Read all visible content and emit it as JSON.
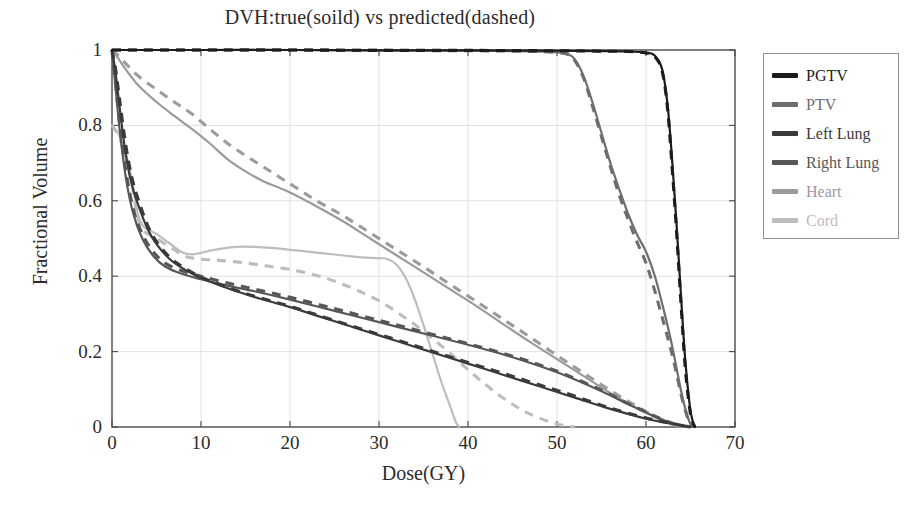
{
  "chart_data": {
    "type": "line",
    "title": "DVH:true(soild) vs predicted(dashed)",
    "xlabel": "Dose(GY)",
    "ylabel": "Fractional Volume",
    "xlim": [
      0,
      70
    ],
    "ylim": [
      0,
      1
    ],
    "xticks": [
      "0",
      "10",
      "20",
      "30",
      "40",
      "50",
      "60",
      "70"
    ],
    "xtick_values": [
      0,
      10,
      20,
      30,
      40,
      50,
      60,
      70
    ],
    "yticks": [
      "0",
      "0.2",
      "0.4",
      "0.6",
      "0.8",
      "1"
    ],
    "ytick_values": [
      0,
      0.2,
      0.4,
      0.6,
      0.8,
      1
    ],
    "grid": true,
    "legend_position": "outside-right-top",
    "linestyles": {
      "true": "solid",
      "predicted": "dashed"
    },
    "series": [
      {
        "name": "PGTV",
        "color": "#1c1c1c",
        "true": {
          "x": [
            0,
            0.5,
            1,
            2,
            5,
            10,
            20,
            30,
            40,
            50,
            55,
            58,
            60,
            61,
            61.8,
            62.4,
            62.9,
            63.4,
            63.9,
            64.4,
            64.9,
            65.2,
            65.5
          ],
          "y": [
            1,
            1,
            1,
            1,
            1,
            1,
            1,
            0.999,
            0.999,
            0.998,
            0.997,
            0.996,
            0.993,
            0.985,
            0.95,
            0.86,
            0.72,
            0.55,
            0.36,
            0.18,
            0.06,
            0.02,
            0
          ]
        },
        "predicted": {
          "x": [
            0,
            0.5,
            1,
            2,
            5,
            10,
            20,
            30,
            40,
            50,
            55,
            58,
            60,
            61,
            61.8,
            62.4,
            62.9,
            63.4,
            63.9,
            64.4,
            64.9,
            65.2,
            65.5
          ],
          "y": [
            1,
            1,
            1,
            1,
            1,
            1,
            1,
            0.999,
            0.999,
            0.998,
            0.997,
            0.996,
            0.992,
            0.982,
            0.945,
            0.85,
            0.7,
            0.53,
            0.34,
            0.16,
            0.05,
            0.015,
            0
          ]
        }
      },
      {
        "name": "PTV",
        "color": "#6e6e6e",
        "true": {
          "x": [
            0,
            1,
            5,
            10,
            20,
            30,
            40,
            45,
            49,
            51,
            52,
            53,
            54,
            55,
            56,
            57,
            58,
            59,
            60,
            61,
            62,
            62.8,
            63.4,
            63.9,
            64.4,
            64.9,
            65.2
          ],
          "y": [
            1,
            1,
            1,
            1,
            1,
            0.999,
            0.998,
            0.997,
            0.995,
            0.99,
            0.975,
            0.93,
            0.86,
            0.78,
            0.7,
            0.63,
            0.565,
            0.51,
            0.465,
            0.4,
            0.31,
            0.23,
            0.16,
            0.1,
            0.05,
            0.012,
            0
          ]
        },
        "predicted": {
          "x": [
            0,
            1,
            5,
            10,
            20,
            30,
            40,
            45,
            49,
            51,
            52,
            53,
            54,
            55,
            56,
            57,
            58,
            59,
            60,
            61,
            62,
            62.8,
            63.4,
            63.9,
            64.4,
            64.9,
            65.2
          ],
          "y": [
            1,
            1,
            1,
            1,
            1,
            0.999,
            0.998,
            0.997,
            0.995,
            0.99,
            0.972,
            0.925,
            0.85,
            0.77,
            0.69,
            0.615,
            0.55,
            0.49,
            0.435,
            0.36,
            0.275,
            0.205,
            0.145,
            0.09,
            0.045,
            0.01,
            0
          ]
        }
      },
      {
        "name": "Left Lung",
        "color": "#3a3a3a",
        "true": {
          "x": [
            0,
            0.4,
            0.9,
            1.5,
            2.2,
            3,
            4,
            5,
            6.5,
            8,
            10,
            13,
            16,
            20,
            24,
            28,
            32,
            36,
            40,
            44,
            48,
            52,
            56,
            60,
            63,
            65
          ],
          "y": [
            1,
            0.94,
            0.84,
            0.73,
            0.645,
            0.585,
            0.525,
            0.485,
            0.445,
            0.42,
            0.395,
            0.368,
            0.345,
            0.318,
            0.288,
            0.258,
            0.228,
            0.198,
            0.168,
            0.138,
            0.108,
            0.078,
            0.048,
            0.022,
            0.008,
            0
          ]
        },
        "predicted": {
          "x": [
            0,
            0.4,
            0.9,
            1.5,
            2.2,
            3,
            4,
            5,
            6.5,
            8,
            10,
            13,
            16,
            20,
            24,
            28,
            32,
            36,
            40,
            44,
            48,
            52,
            56,
            60,
            63,
            65
          ],
          "y": [
            1,
            0.95,
            0.86,
            0.755,
            0.665,
            0.6,
            0.535,
            0.492,
            0.45,
            0.424,
            0.398,
            0.37,
            0.347,
            0.32,
            0.29,
            0.26,
            0.231,
            0.201,
            0.171,
            0.142,
            0.112,
            0.082,
            0.05,
            0.024,
            0.009,
            0
          ]
        }
      },
      {
        "name": "Right Lung",
        "color": "#575757",
        "true": {
          "x": [
            0,
            0.4,
            0.9,
            1.6,
            2.4,
            3.4,
            4.6,
            6,
            8,
            10,
            13,
            16,
            20,
            25,
            30,
            35,
            40,
            45,
            50,
            55,
            58,
            61,
            63,
            65
          ],
          "y": [
            1,
            0.9,
            0.78,
            0.655,
            0.565,
            0.5,
            0.455,
            0.425,
            0.405,
            0.392,
            0.375,
            0.36,
            0.338,
            0.308,
            0.278,
            0.248,
            0.218,
            0.185,
            0.145,
            0.095,
            0.06,
            0.028,
            0.01,
            0
          ]
        },
        "predicted": {
          "x": [
            0,
            0.4,
            0.9,
            1.6,
            2.4,
            3.4,
            4.6,
            6,
            8,
            10,
            13,
            16,
            20,
            25,
            30,
            35,
            40,
            45,
            50,
            55,
            58,
            61,
            63,
            65
          ],
          "y": [
            1,
            0.91,
            0.795,
            0.672,
            0.578,
            0.512,
            0.466,
            0.434,
            0.413,
            0.4,
            0.382,
            0.366,
            0.344,
            0.314,
            0.283,
            0.252,
            0.221,
            0.188,
            0.148,
            0.098,
            0.062,
            0.029,
            0.01,
            0
          ]
        }
      },
      {
        "name": "Heart",
        "color": "#9b9b9b",
        "true": {
          "x": [
            0,
            0.5,
            1.5,
            3,
            5,
            7,
            9,
            11,
            13,
            15,
            17,
            20,
            23,
            26,
            29,
            32,
            35,
            38,
            41,
            44,
            47,
            50,
            53,
            56,
            59,
            62,
            64
          ],
          "y": [
            1,
            0.985,
            0.95,
            0.905,
            0.862,
            0.825,
            0.79,
            0.752,
            0.71,
            0.678,
            0.652,
            0.622,
            0.585,
            0.545,
            0.5,
            0.455,
            0.41,
            0.365,
            0.32,
            0.272,
            0.225,
            0.18,
            0.135,
            0.09,
            0.05,
            0.015,
            0
          ]
        },
        "predicted": {
          "x": [
            0,
            0.5,
            1.5,
            3,
            5,
            7,
            9,
            11,
            13,
            15,
            17,
            20,
            23,
            26,
            29,
            32,
            35,
            38,
            41,
            44,
            47,
            50,
            53,
            56,
            59,
            62,
            64
          ],
          "y": [
            1,
            0.99,
            0.965,
            0.93,
            0.895,
            0.862,
            0.83,
            0.79,
            0.752,
            0.72,
            0.69,
            0.645,
            0.6,
            0.56,
            0.515,
            0.47,
            0.425,
            0.378,
            0.332,
            0.285,
            0.238,
            0.19,
            0.143,
            0.097,
            0.054,
            0.016,
            0
          ]
        }
      },
      {
        "name": "Cord",
        "color": "#bdbdbd",
        "true": {
          "x": [
            0,
            0.3,
            0.8,
            1.5,
            2.2,
            2.8,
            3.2,
            3.6,
            4.2,
            5,
            6,
            7,
            8,
            9,
            10,
            11,
            12,
            14,
            16,
            18,
            20,
            22,
            24,
            26,
            28,
            30,
            31,
            32,
            33,
            34,
            35,
            36,
            37,
            38,
            38.6,
            39
          ],
          "y": [
            0.8,
            0.79,
            0.775,
            0.73,
            0.66,
            0.575,
            0.545,
            0.53,
            0.522,
            0.512,
            0.495,
            0.478,
            0.462,
            0.458,
            0.462,
            0.468,
            0.472,
            0.478,
            0.478,
            0.475,
            0.47,
            0.465,
            0.46,
            0.455,
            0.45,
            0.448,
            0.445,
            0.43,
            0.395,
            0.34,
            0.27,
            0.195,
            0.12,
            0.055,
            0.015,
            0
          ]
        },
        "predicted": {
          "x": [
            0,
            0.3,
            0.8,
            1.5,
            2.2,
            2.8,
            3.2,
            3.6,
            4.2,
            5,
            6,
            7,
            8,
            9,
            10,
            12,
            14,
            16,
            18,
            20,
            22,
            24,
            26,
            28,
            30,
            32,
            34,
            36,
            38,
            40,
            42,
            44,
            46,
            48,
            50,
            52
          ],
          "y": [
            0.8,
            0.79,
            0.77,
            0.72,
            0.65,
            0.565,
            0.535,
            0.52,
            0.51,
            0.5,
            0.485,
            0.47,
            0.455,
            0.448,
            0.445,
            0.442,
            0.438,
            0.432,
            0.425,
            0.418,
            0.408,
            0.395,
            0.378,
            0.358,
            0.335,
            0.305,
            0.272,
            0.235,
            0.195,
            0.152,
            0.112,
            0.076,
            0.046,
            0.024,
            0.008,
            0
          ]
        }
      }
    ]
  },
  "legend": {
    "items": [
      {
        "label": "PGTV",
        "color": "#1c1c1c"
      },
      {
        "label": "PTV",
        "color": "#6e6e6e"
      },
      {
        "label": "Left Lung",
        "color": "#3a3a3a"
      },
      {
        "label": "Right Lung",
        "color": "#575757"
      },
      {
        "label": "Heart",
        "color": "#9b9b9b"
      },
      {
        "label": "Cord",
        "color": "#bdbdbd"
      }
    ]
  },
  "colors": {
    "axis": "#4a4a4a",
    "grid": "#e0e0e0",
    "background": "#ffffff",
    "text": "#2b2b2b"
  }
}
